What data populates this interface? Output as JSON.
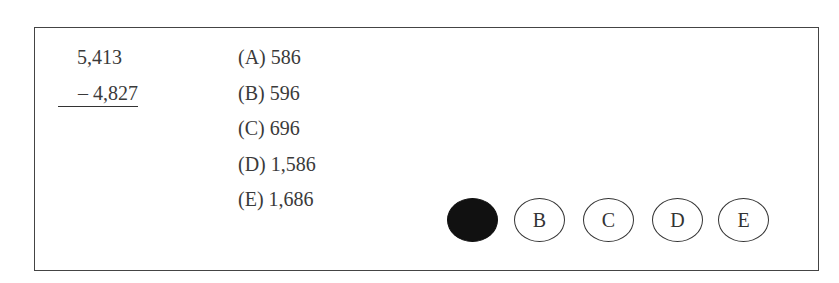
{
  "problem": {
    "minuend": "5,413",
    "subtrahend": "– 4,827",
    "operation": "subtraction"
  },
  "choices": [
    {
      "label": "(A) 586"
    },
    {
      "label": "(B) 596"
    },
    {
      "label": "(C) 696"
    },
    {
      "label": "(D) 1,586"
    },
    {
      "label": "(E) 1,686"
    }
  ],
  "answer_bubbles": [
    {
      "letter": "A",
      "filled": true
    },
    {
      "letter": "B",
      "filled": false
    },
    {
      "letter": "C",
      "filled": false
    },
    {
      "letter": "D",
      "filled": false
    },
    {
      "letter": "E",
      "filled": false
    }
  ]
}
